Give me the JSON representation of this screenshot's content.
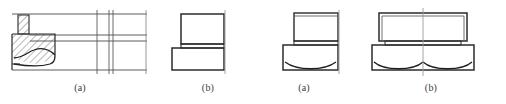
{
  "figure": {
    "kind": "engineering-drawing-plate",
    "background_color": "#ffffff",
    "line_color": "#2b2b2b",
    "thin_line_color": "#6e6e6e",
    "center_line_color": "#9a9a9a",
    "hatch_color": "#4a4a4a",
    "caption_color": "#3a3a3a"
  },
  "panels": [
    {
      "id": "panel-left-a",
      "caption": "(a)",
      "description": "sectional view with hatched flange and construction lines"
    },
    {
      "id": "panel-left-b",
      "caption": "(b)",
      "description": "outline view of stepped block, two rectangles"
    },
    {
      "id": "panel-right-a",
      "caption": "(a)",
      "description": "single bearing block with concave arc bottom"
    },
    {
      "id": "panel-right-b",
      "caption": "(b)",
      "description": "double-width bearing block with two concave arcs and center line"
    }
  ],
  "captions": {
    "left_a": "(a)",
    "left_b": "(b)",
    "right_a": "(a)",
    "right_b": "(b)"
  }
}
